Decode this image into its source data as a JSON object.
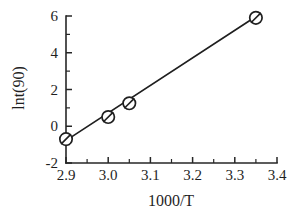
{
  "chart_data": {
    "type": "scatter",
    "title": "",
    "xlabel": "1000/T",
    "ylabel": "lnt(90)",
    "xlim": [
      2.9,
      3.4
    ],
    "ylim": [
      -2,
      6
    ],
    "grid": false,
    "legend": null,
    "x_ticks": [
      "2.9",
      "3.0",
      "3.1",
      "3.2",
      "3.3",
      "3.4"
    ],
    "x_tick_values": [
      2.9,
      3.0,
      3.1,
      3.2,
      3.3,
      3.4
    ],
    "x_minor_step": 0.05,
    "y_ticks": [
      "-2",
      "0",
      "2",
      "4",
      "6"
    ],
    "y_tick_values": [
      -2,
      0,
      2,
      4,
      6
    ],
    "y_minor_step": 1,
    "marker_style": "open-circle-with-slash",
    "points": [
      {
        "x": 2.9,
        "y": -0.7
      },
      {
        "x": 3.0,
        "y": 0.5
      },
      {
        "x": 3.05,
        "y": 1.25
      },
      {
        "x": 3.35,
        "y": 5.9
      }
    ],
    "series": [
      {
        "name": "lnt(90) vs 1000/T",
        "x": [
          2.9,
          3.0,
          3.05,
          3.35
        ],
        "values": [
          -0.7,
          0.5,
          1.25,
          5.9
        ]
      }
    ],
    "fit_line": {
      "type": "linear",
      "x_start": 2.895,
      "y_start": -0.85,
      "x_end": 3.352,
      "y_end": 6.0
    }
  },
  "colors": {
    "line": "#1f1f1f",
    "axis": "#262626",
    "marker_fill": "#ffffff",
    "background": "#ffffff"
  }
}
